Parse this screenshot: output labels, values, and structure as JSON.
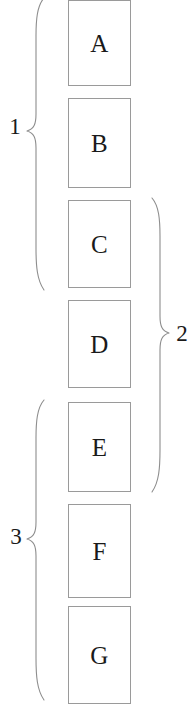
{
  "figure": {
    "type": "bracket-grouping-diagram",
    "background_color": "#ffffff",
    "box_border_color": "#9a9a9a",
    "brace_stroke_color": "#8d8d8d",
    "text_color": "#1a1a1a"
  },
  "boxes": [
    {
      "label": "A",
      "x": 68,
      "y": 0,
      "width": 63,
      "height": 86
    },
    {
      "label": "B",
      "x": 68,
      "y": 98,
      "width": 63,
      "height": 90
    },
    {
      "label": "C",
      "x": 68,
      "y": 200,
      "width": 63,
      "height": 88
    },
    {
      "label": "D",
      "x": 68,
      "y": 300,
      "width": 63,
      "height": 88
    },
    {
      "label": "E",
      "x": 68,
      "y": 402,
      "width": 63,
      "height": 90
    },
    {
      "label": "F",
      "x": 68,
      "y": 504,
      "width": 63,
      "height": 94
    },
    {
      "label": "G",
      "x": 68,
      "y": 606,
      "width": 63,
      "height": 98
    }
  ],
  "braces": [
    {
      "label": "1",
      "side": "left",
      "spans_boxes": [
        "A",
        "B",
        "C"
      ],
      "top": 0,
      "bottom": 288,
      "label_x": 15,
      "label_y": 127
    },
    {
      "label": "2",
      "side": "right",
      "spans_boxes": [
        "C",
        "D",
        "E"
      ],
      "top": 200,
      "bottom": 490,
      "label_x": 182,
      "label_y": 335
    },
    {
      "label": "3",
      "side": "left",
      "spans_boxes": [
        "E",
        "F",
        "G"
      ],
      "top": 400,
      "bottom": 700,
      "label_x": 16,
      "label_y": 537
    }
  ]
}
